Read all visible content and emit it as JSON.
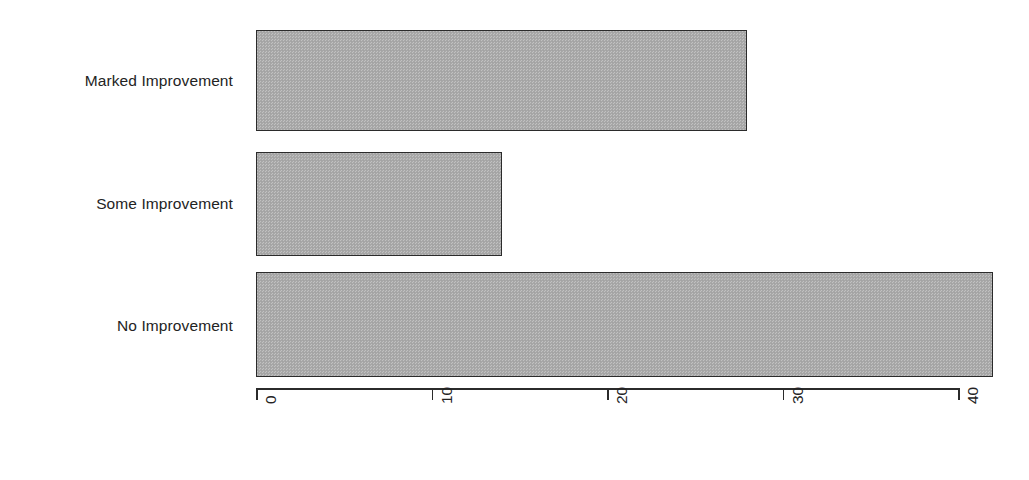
{
  "chart_data": {
    "type": "bar",
    "orientation": "horizontal",
    "title": "",
    "subtitle": "",
    "xlabel": "",
    "ylabel": "",
    "categories": [
      "No Improvement",
      "Some Improvement",
      "Marked Improvement"
    ],
    "values": [
      42,
      14,
      28
    ],
    "bars": [
      {
        "category": "Marked Improvement",
        "value": 28
      },
      {
        "category": "Some Improvement",
        "value": 14
      },
      {
        "category": "No Improvement",
        "value": 42
      }
    ],
    "xlim": [
      0,
      42
    ],
    "xticks": [
      0,
      10,
      20,
      30,
      40
    ],
    "xtick_labels": [
      "0",
      "10",
      "20",
      "30",
      "40"
    ],
    "xtick_label_rotation": 90,
    "grid": false,
    "legend": null,
    "colors": {
      "bar_fill": "#a9a9a9",
      "bar_border": "#2b2b2b",
      "axis": "#2b2b2b",
      "text": "#232323",
      "background": "#ffffff"
    }
  },
  "axis": {
    "ticks": [
      {
        "label": "0",
        "value": 0
      },
      {
        "label": "10",
        "value": 10
      },
      {
        "label": "20",
        "value": 20
      },
      {
        "label": "30",
        "value": 30
      },
      {
        "label": "40",
        "value": 40
      }
    ]
  },
  "bars": [
    {
      "label": "Marked Improvement",
      "value": 28
    },
    {
      "label": "Some Improvement",
      "value": 14
    },
    {
      "label": "No Improvement",
      "value": 42
    }
  ]
}
